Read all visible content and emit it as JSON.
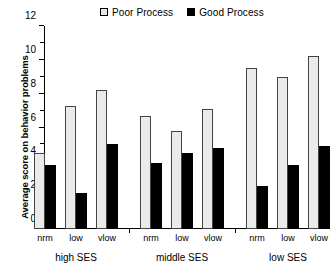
{
  "chart_data": {
    "type": "bar",
    "title": "",
    "subtitle": "",
    "xlabel": "",
    "ylabel": "Average score on behavior problems",
    "ylim": [
      0,
      12
    ],
    "ytick_labels": [
      "0",
      "2",
      "4",
      "6",
      "8",
      "10",
      "12"
    ],
    "ytick_values": [
      0,
      2,
      4,
      6,
      8,
      10,
      12
    ],
    "yminor_step": 1,
    "grid": false,
    "legend_position": "top-right",
    "groups": [
      "high SES",
      "middle SES",
      "low SES"
    ],
    "categories": [
      "nrm",
      "low",
      "vlow",
      "nrm",
      "low",
      "vlow",
      "nrm",
      "low",
      "vlow"
    ],
    "series": [
      {
        "name": "Poor Process",
        "color": "#eaeaea",
        "values": [
          4.5,
          7.3,
          8.2,
          6.7,
          5.8,
          7.1,
          9.5,
          9.0,
          10.2
        ]
      },
      {
        "name": "Good Process",
        "color": "#000000",
        "values": [
          3.8,
          2.1,
          5.0,
          3.9,
          4.5,
          4.8,
          2.55,
          3.8,
          4.9
        ]
      }
    ],
    "annotations": []
  },
  "legend": {
    "entries": [
      {
        "label": "Poor Process",
        "swatch": "open-square-icon"
      },
      {
        "label": "Good Process",
        "swatch": "filled-square-icon"
      }
    ]
  },
  "axis": {
    "y_title": "Average score on behavior problems"
  }
}
